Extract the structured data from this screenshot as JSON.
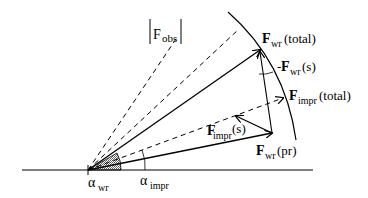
{
  "diagram": {
    "labels": {
      "f_obs": "|Fobs|",
      "f_obs_main": "F",
      "f_obs_sub": "obs",
      "f_wr_total_main": "F",
      "f_wr_total_sub": "wr",
      "f_wr_total_suffix": "(total)",
      "neg_f_wr_s_prefix": "-",
      "neg_f_wr_s_main": "F",
      "neg_f_wr_s_sub": "wr",
      "neg_f_wr_s_suffix": "(s)",
      "f_impr_total_main": "F",
      "f_impr_total_sub": "impr",
      "f_impr_total_suffix": "(total)",
      "f_impr_s_main": "F",
      "f_impr_s_sub": "impr",
      "f_impr_s_suffix": "(s)",
      "f_wr_pr_main": "F",
      "f_wr_pr_sub": "wr",
      "f_wr_pr_suffix": "(pr)",
      "alpha_wr_main": "α",
      "alpha_wr_sub": "wr",
      "alpha_impr_main": "α",
      "alpha_impr_sub": "impr"
    },
    "colors": {
      "stroke": "#000000",
      "shade": "#b8b8b8",
      "background": "#ffffff"
    }
  }
}
